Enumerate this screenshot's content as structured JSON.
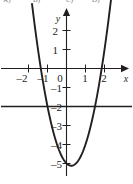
{
  "figure": {
    "width": 133,
    "height": 184,
    "background_color": "#ffffff",
    "ink_color": "#231f20"
  },
  "cutoff_header": {
    "note": "row of clipped answer-choice text along the very top edge, only descenders visible",
    "fragment_1": "A)",
    "fragment_2": "B)",
    "fragment_3": "C)",
    "fragment_4": "D)"
  },
  "axes": {
    "x_axis_label": "x",
    "y_axis_label": "y",
    "origin_label": "0",
    "x_ticks": [
      "–2",
      "–1",
      "1",
      "2"
    ],
    "y_ticks": [
      "2",
      "1",
      "–1",
      "–2",
      "–3",
      "–4",
      "–5"
    ],
    "x_arrow": "right-arrow",
    "y_arrow": "up-arrow"
  },
  "chart_data": {
    "type": "line",
    "title": "",
    "subtitle": "",
    "xlabel": "x",
    "ylabel": "y",
    "xlim": [
      -2.6,
      2.9
    ],
    "ylim": [
      -5.6,
      2.9
    ],
    "xticks": [
      -2,
      -1,
      0,
      1,
      2
    ],
    "yticks": [
      2,
      1,
      0,
      -1,
      -2,
      -3,
      -4,
      -5
    ],
    "xticklabels": [
      "–2",
      "–1",
      "0",
      "1",
      "2"
    ],
    "yticklabels": [
      "2",
      "1",
      "0",
      "–1",
      "–2",
      "–3",
      "–4",
      "–5"
    ],
    "grid": false,
    "legend": "none",
    "series": [
      {
        "name": "parabola",
        "type": "parabola",
        "equation": "y = 2x^2 - x - 5",
        "orientation": "opens-upward",
        "vertex": [
          0.25,
          -5.12
        ],
        "roots": [
          -1.35,
          1.85
        ],
        "visible_x_range": [
          -1.78,
          2.2
        ],
        "points": [
          [
            -1.78,
            3.11
          ],
          [
            -1.6,
            2.32
          ],
          [
            -1.4,
            1.32
          ],
          [
            -1.2,
            0.48
          ],
          [
            -1.0,
            -2.0
          ],
          [
            -0.8,
            -2.92
          ],
          [
            -0.6,
            -3.68
          ],
          [
            -0.4,
            -4.28
          ],
          [
            -0.2,
            -4.72
          ],
          [
            0.0,
            -5.0
          ],
          [
            0.25,
            -5.12
          ],
          [
            0.5,
            -5.0
          ],
          [
            0.7,
            -4.72
          ],
          [
            0.9,
            -4.28
          ],
          [
            1.1,
            -3.68
          ],
          [
            1.3,
            -2.92
          ],
          [
            1.5,
            -2.0
          ],
          [
            1.7,
            -0.92
          ],
          [
            1.9,
            0.32
          ],
          [
            2.1,
            1.72
          ],
          [
            2.2,
            2.48
          ]
        ]
      },
      {
        "name": "horizontal-line",
        "type": "horizontal-line",
        "equation": "y = -2",
        "y_value": -2,
        "x_range": [
          -2.6,
          2.9
        ]
      }
    ],
    "intersections": [
      [
        -1.0,
        -2.0
      ],
      [
        1.5,
        -2.0
      ]
    ]
  }
}
